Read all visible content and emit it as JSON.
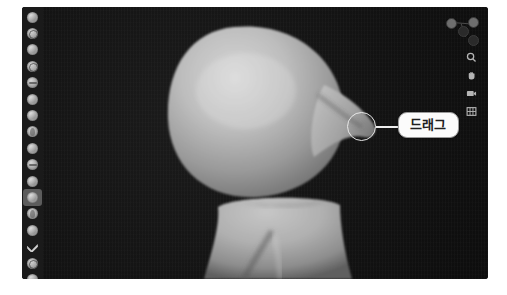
{
  "app": {
    "name": "3D Sculpting Viewport",
    "viewport_background": "#141414",
    "shelf_background": "#1a1a1a",
    "model_material_color": "#b8b8b8",
    "accent_highlight": "#5c5c5c"
  },
  "tool_shelf": {
    "label": "Sculpt Tools",
    "active_index": 11,
    "items": [
      {
        "name": "tool-draw",
        "icon": "brush-draw-icon"
      },
      {
        "name": "tool-draw-sharp",
        "icon": "brush-draw-sharp-icon"
      },
      {
        "name": "tool-clay",
        "icon": "brush-clay-icon"
      },
      {
        "name": "tool-clay-strips",
        "icon": "brush-clay-strips-icon"
      },
      {
        "name": "tool-layer",
        "icon": "brush-layer-icon"
      },
      {
        "name": "tool-inflate",
        "icon": "brush-inflate-icon"
      },
      {
        "name": "tool-blob",
        "icon": "brush-blob-icon"
      },
      {
        "name": "tool-crease",
        "icon": "brush-crease-icon"
      },
      {
        "name": "tool-smooth",
        "icon": "brush-smooth-icon"
      },
      {
        "name": "tool-flatten",
        "icon": "brush-flatten-icon"
      },
      {
        "name": "tool-fill",
        "icon": "brush-fill-icon"
      },
      {
        "name": "tool-snake-hook",
        "icon": "brush-snake-hook-icon"
      },
      {
        "name": "tool-thumb",
        "icon": "brush-thumb-icon"
      },
      {
        "name": "tool-pinch",
        "icon": "brush-pinch-icon"
      },
      {
        "name": "tool-grab",
        "icon": "brush-grab-icon"
      },
      {
        "name": "tool-mask",
        "icon": "brush-mask-icon"
      },
      {
        "name": "tool-face-set",
        "icon": "brush-face-set-icon"
      }
    ]
  },
  "nav_gizmo": {
    "label": "View Orientation Gizmo",
    "axes": [
      "x",
      "y",
      "z"
    ]
  },
  "view_tools": {
    "items": [
      {
        "name": "zoom-view",
        "icon": "magnifier-icon"
      },
      {
        "name": "move-view",
        "icon": "hand-icon"
      },
      {
        "name": "camera-view",
        "icon": "camera-icon"
      },
      {
        "name": "toggle-orthographic",
        "icon": "grid-icon"
      }
    ]
  },
  "annotation": {
    "label": "드래그",
    "circle_label": "drag-target-highlight",
    "description": "Callout marking the dragged sculpt protrusion"
  }
}
